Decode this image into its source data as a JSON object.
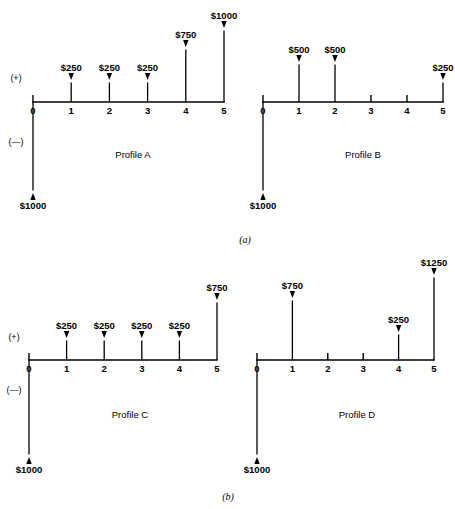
{
  "figure": {
    "panels": [
      {
        "id": "a",
        "caption": "(a)"
      },
      {
        "id": "b",
        "caption": "(b)"
      }
    ],
    "sign_labels": {
      "positive": "(+)",
      "negative": "(—)"
    },
    "tick_labels": [
      "0",
      "1",
      "2",
      "3",
      "4",
      "5"
    ]
  },
  "chart_data": {
    "type": "bar",
    "xlabel": "",
    "ylabel": "",
    "grid": false,
    "legend": "none",
    "x": [
      0,
      1,
      2,
      3,
      4,
      5
    ],
    "xlim": [
      0,
      5
    ],
    "axis_sign_labels": {
      "above_axis": "(+)",
      "below_axis": "(—)"
    },
    "panels": [
      {
        "panel": "(a)",
        "charts": [
          "Profile A",
          "Profile B"
        ]
      },
      {
        "panel": "(b)",
        "charts": [
          "Profile C",
          "Profile D"
        ]
      }
    ],
    "series": [
      {
        "name": "Profile A",
        "panel": "(a)",
        "values": [
          -1000,
          250,
          250,
          250,
          750,
          1000
        ],
        "labels": [
          "$1000",
          "$250",
          "$250",
          "$250",
          "$750",
          "$1000"
        ],
        "directions": [
          "down",
          "up",
          "up",
          "up",
          "up",
          "up"
        ]
      },
      {
        "name": "Profile B",
        "panel": "(a)",
        "values": [
          -1000,
          500,
          500,
          0,
          0,
          250
        ],
        "labels": [
          "$1000",
          "$500",
          "$500",
          "",
          "",
          "$250"
        ],
        "directions": [
          "down",
          "up",
          "up",
          "none",
          "none",
          "up"
        ]
      },
      {
        "name": "Profile C",
        "panel": "(b)",
        "values": [
          -1000,
          250,
          250,
          250,
          250,
          750
        ],
        "labels": [
          "$1000",
          "$250",
          "$250",
          "$250",
          "$250",
          "$750"
        ],
        "directions": [
          "down",
          "up",
          "up",
          "up",
          "up",
          "up"
        ]
      },
      {
        "name": "Profile D",
        "panel": "(b)",
        "values": [
          -1000,
          750,
          0,
          0,
          250,
          1250
        ],
        "labels": [
          "$1000",
          "$750",
          "",
          "",
          "$250",
          "$1250"
        ],
        "directions": [
          "down",
          "up",
          "none",
          "none",
          "up",
          "up"
        ]
      }
    ]
  },
  "diagrams": [
    {
      "name": "Profile A",
      "caption": "Profile A",
      "panel": "(a)",
      "origin_x": 33,
      "baseline_y": 102,
      "step_x": 38.2,
      "caption_x": 133,
      "caption_y": 158,
      "show_signs": true,
      "sign_positive_x": 16,
      "sign_positive_y": 81,
      "sign_negative_x": 16,
      "sign_negative_y": 145,
      "flows": [
        {
          "period": 0,
          "label": "$1000",
          "direction": "down",
          "length": 91,
          "label_offset": 14
        },
        {
          "period": 1,
          "label": "$250",
          "direction": "up",
          "length": 22,
          "label_offset": 9
        },
        {
          "period": 2,
          "label": "$250",
          "direction": "up",
          "length": 22,
          "label_offset": 9
        },
        {
          "period": 3,
          "label": "$250",
          "direction": "up",
          "length": 22,
          "label_offset": 9
        },
        {
          "period": 4,
          "label": "$750",
          "direction": "up",
          "length": 55,
          "label_offset": 9
        },
        {
          "period": 5,
          "label": "$1000",
          "direction": "up",
          "length": 74,
          "label_offset": 9
        }
      ]
    },
    {
      "name": "Profile B",
      "caption": "Profile B",
      "panel": "(a)",
      "origin_x": 263,
      "baseline_y": 102,
      "step_x": 36.0,
      "caption_x": 363,
      "caption_y": 158,
      "show_signs": false,
      "sign_positive_x": 0,
      "sign_positive_y": 0,
      "sign_negative_x": 0,
      "sign_negative_y": 0,
      "flows": [
        {
          "period": 0,
          "label": "$1000",
          "direction": "down",
          "length": 91,
          "label_offset": 14
        },
        {
          "period": 1,
          "label": "$500",
          "direction": "up",
          "length": 40,
          "label_offset": 9
        },
        {
          "period": 2,
          "label": "$500",
          "direction": "up",
          "length": 40,
          "label_offset": 9
        },
        {
          "period": 3,
          "label": "",
          "direction": "none",
          "length": 0,
          "label_offset": 0
        },
        {
          "period": 4,
          "label": "",
          "direction": "none",
          "length": 0,
          "label_offset": 0
        },
        {
          "period": 5,
          "label": "$250",
          "direction": "up",
          "length": 22,
          "label_offset": 9
        }
      ]
    },
    {
      "name": "Profile C",
      "caption": "Profile C",
      "panel": "(b)",
      "origin_x": 29,
      "baseline_y": 360,
      "step_x": 37.6,
      "caption_x": 130,
      "caption_y": 418,
      "show_signs": true,
      "sign_positive_x": 14,
      "sign_positive_y": 340,
      "sign_negative_x": 14,
      "sign_negative_y": 393,
      "flows": [
        {
          "period": 0,
          "label": "$1000",
          "direction": "down",
          "length": 97,
          "label_offset": 14
        },
        {
          "period": 1,
          "label": "$250",
          "direction": "up",
          "length": 22,
          "label_offset": 9
        },
        {
          "period": 2,
          "label": "$250",
          "direction": "up",
          "length": 22,
          "label_offset": 9
        },
        {
          "period": 3,
          "label": "$250",
          "direction": "up",
          "length": 22,
          "label_offset": 9
        },
        {
          "period": 4,
          "label": "$250",
          "direction": "up",
          "length": 22,
          "label_offset": 9
        },
        {
          "period": 5,
          "label": "$750",
          "direction": "up",
          "length": 60,
          "label_offset": 9
        }
      ]
    },
    {
      "name": "Profile D",
      "caption": "Profile D",
      "panel": "(b)",
      "origin_x": 257,
      "baseline_y": 360,
      "step_x": 35.4,
      "caption_x": 357,
      "caption_y": 418,
      "show_signs": false,
      "sign_positive_x": 0,
      "sign_positive_y": 0,
      "sign_negative_x": 0,
      "sign_negative_y": 0,
      "flows": [
        {
          "period": 0,
          "label": "$1000",
          "direction": "down",
          "length": 97,
          "label_offset": 14
        },
        {
          "period": 1,
          "label": "$750",
          "direction": "up",
          "length": 62,
          "label_offset": 9
        },
        {
          "period": 2,
          "label": "",
          "direction": "none",
          "length": 0,
          "label_offset": 0
        },
        {
          "period": 3,
          "label": "",
          "direction": "none",
          "length": 0,
          "label_offset": 0
        },
        {
          "period": 4,
          "label": "$250",
          "direction": "up",
          "length": 28,
          "label_offset": 9
        },
        {
          "period": 5,
          "label": "$1250",
          "direction": "up",
          "length": 85,
          "label_offset": 9
        }
      ]
    }
  ],
  "panel_captions": [
    {
      "text": "(a)",
      "x": 245,
      "y": 243
    },
    {
      "text": "(b)",
      "x": 228,
      "y": 500
    }
  ]
}
